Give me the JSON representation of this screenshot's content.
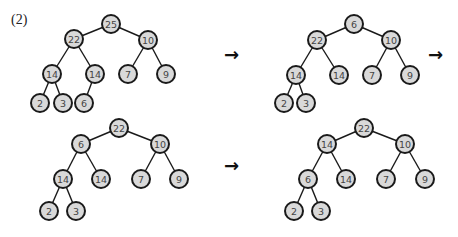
{
  "figure": {
    "label": "(2)",
    "arrow_glyph": "→",
    "colors": {
      "node_fill": "#d9d9d9",
      "node_stroke": "#1a1a1a",
      "edge": "#1a1a1a",
      "text": "#444444"
    }
  },
  "trees": [
    {
      "name": "step-1",
      "nodes": [
        {
          "id": "a",
          "v": "25",
          "x": 111,
          "y": 24
        },
        {
          "id": "b",
          "v": "22",
          "x": 74,
          "y": 39
        },
        {
          "id": "c",
          "v": "10",
          "x": 148,
          "y": 40
        },
        {
          "id": "d",
          "v": "14",
          "x": 52,
          "y": 74
        },
        {
          "id": "e",
          "v": "14",
          "x": 95,
          "y": 74
        },
        {
          "id": "f",
          "v": "7",
          "x": 128,
          "y": 74
        },
        {
          "id": "g",
          "v": "9",
          "x": 166,
          "y": 74
        },
        {
          "id": "h",
          "v": "2",
          "x": 40,
          "y": 103
        },
        {
          "id": "i",
          "v": "3",
          "x": 63,
          "y": 103
        },
        {
          "id": "j",
          "v": "6",
          "x": 84,
          "y": 103
        }
      ],
      "edges": [
        [
          "a",
          "b"
        ],
        [
          "a",
          "c"
        ],
        [
          "b",
          "d"
        ],
        [
          "b",
          "e"
        ],
        [
          "c",
          "f"
        ],
        [
          "c",
          "g"
        ],
        [
          "d",
          "h"
        ],
        [
          "d",
          "i"
        ],
        [
          "e",
          "j"
        ]
      ]
    },
    {
      "name": "step-2",
      "nodes": [
        {
          "id": "a",
          "v": "6",
          "x": 354,
          "y": 24
        },
        {
          "id": "b",
          "v": "22",
          "x": 317,
          "y": 40
        },
        {
          "id": "c",
          "v": "10",
          "x": 391,
          "y": 40
        },
        {
          "id": "d",
          "v": "14",
          "x": 296,
          "y": 75
        },
        {
          "id": "e",
          "v": "14",
          "x": 339,
          "y": 75
        },
        {
          "id": "f",
          "v": "7",
          "x": 372,
          "y": 75
        },
        {
          "id": "g",
          "v": "9",
          "x": 410,
          "y": 75
        },
        {
          "id": "h",
          "v": "2",
          "x": 284,
          "y": 103
        },
        {
          "id": "i",
          "v": "3",
          "x": 306,
          "y": 103
        }
      ],
      "edges": [
        [
          "a",
          "b"
        ],
        [
          "a",
          "c"
        ],
        [
          "b",
          "d"
        ],
        [
          "b",
          "e"
        ],
        [
          "c",
          "f"
        ],
        [
          "c",
          "g"
        ],
        [
          "d",
          "h"
        ],
        [
          "d",
          "i"
        ]
      ]
    },
    {
      "name": "step-3",
      "nodes": [
        {
          "id": "a",
          "v": "22",
          "x": 119,
          "y": 128
        },
        {
          "id": "b",
          "v": "6",
          "x": 81,
          "y": 144
        },
        {
          "id": "c",
          "v": "10",
          "x": 160,
          "y": 144
        },
        {
          "id": "d",
          "v": "14",
          "x": 63,
          "y": 179
        },
        {
          "id": "e",
          "v": "14",
          "x": 101,
          "y": 179
        },
        {
          "id": "f",
          "v": "7",
          "x": 141,
          "y": 179
        },
        {
          "id": "g",
          "v": "9",
          "x": 179,
          "y": 179
        },
        {
          "id": "h",
          "v": "2",
          "x": 49,
          "y": 211
        },
        {
          "id": "i",
          "v": "3",
          "x": 76,
          "y": 211
        }
      ],
      "edges": [
        [
          "a",
          "b"
        ],
        [
          "a",
          "c"
        ],
        [
          "b",
          "d"
        ],
        [
          "b",
          "e"
        ],
        [
          "c",
          "f"
        ],
        [
          "c",
          "g"
        ],
        [
          "d",
          "h"
        ],
        [
          "d",
          "i"
        ]
      ]
    },
    {
      "name": "step-4",
      "nodes": [
        {
          "id": "a",
          "v": "22",
          "x": 364,
          "y": 128
        },
        {
          "id": "b",
          "v": "14",
          "x": 327,
          "y": 144
        },
        {
          "id": "c",
          "v": "10",
          "x": 405,
          "y": 144
        },
        {
          "id": "d",
          "v": "6",
          "x": 308,
          "y": 179
        },
        {
          "id": "e",
          "v": "14",
          "x": 346,
          "y": 179
        },
        {
          "id": "f",
          "v": "7",
          "x": 386,
          "y": 179
        },
        {
          "id": "g",
          "v": "9",
          "x": 425,
          "y": 179
        },
        {
          "id": "h",
          "v": "2",
          "x": 294,
          "y": 211
        },
        {
          "id": "i",
          "v": "3",
          "x": 321,
          "y": 211
        }
      ],
      "edges": [
        [
          "a",
          "b"
        ],
        [
          "a",
          "c"
        ],
        [
          "b",
          "d"
        ],
        [
          "b",
          "e"
        ],
        [
          "c",
          "f"
        ],
        [
          "c",
          "g"
        ],
        [
          "d",
          "h"
        ],
        [
          "d",
          "i"
        ]
      ]
    }
  ],
  "arrows": [
    {
      "name": "arrow-1-to-2",
      "x": 224,
      "y": 46
    },
    {
      "name": "arrow-2-to-3",
      "x": 428,
      "y": 46
    },
    {
      "name": "arrow-3-to-4",
      "x": 224,
      "y": 157
    }
  ]
}
